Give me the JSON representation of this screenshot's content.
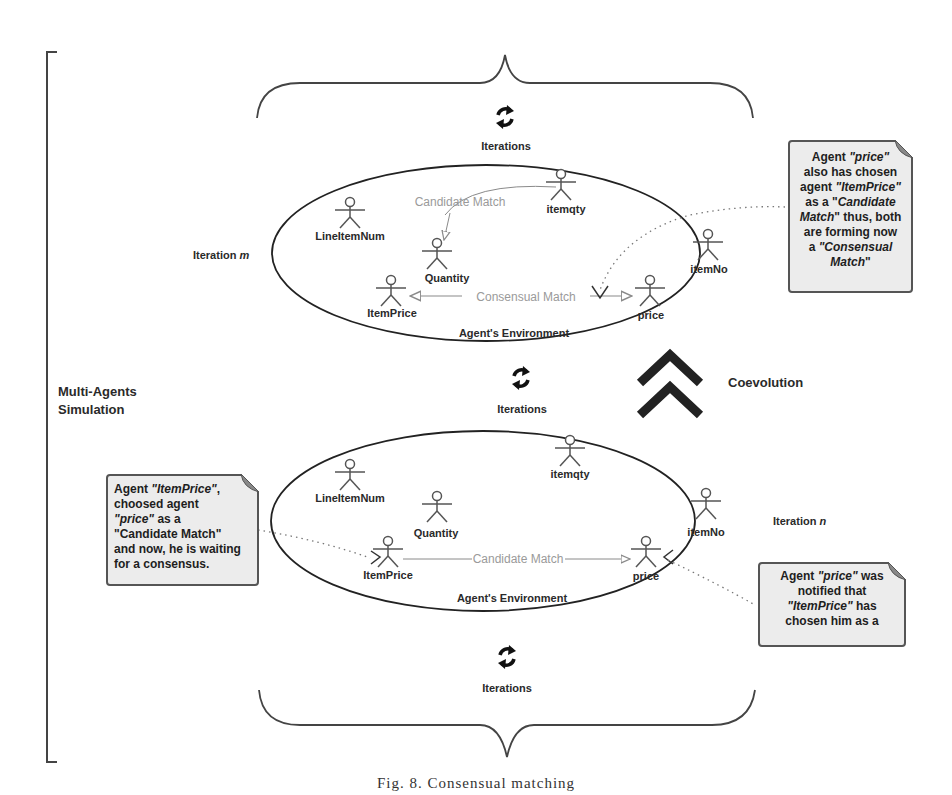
{
  "diagram": {
    "side_label": "Multi-Agents Simulation",
    "side_label_lines": [
      "Multi-Agents",
      "Simulation"
    ],
    "coevolution_label": "Coevolution",
    "iterations_labels": [
      "Iterations",
      "Iterations",
      "Iterations"
    ],
    "iteration_m": {
      "label": "Iteration ",
      "var": "m"
    },
    "iteration_n": {
      "label": "Iteration ",
      "var": "n"
    },
    "env_top": {
      "environment_label": "Agent's Environment",
      "agents": [
        "LineItemNum",
        "itemqty",
        "Quantity",
        "ItemPrice",
        "price",
        "itemNo"
      ],
      "candidate_match_label": "Candidate Match",
      "consensual_match_label": "Consensual Match"
    },
    "env_bottom": {
      "environment_label": "Agent's Environment",
      "agents": [
        "LineItemNum",
        "itemqty",
        "Quantity",
        "ItemPrice",
        "price",
        "itemNo"
      ],
      "candidate_match_label": "Candidate Match"
    },
    "notes": {
      "top_right": {
        "lines": [
          [
            {
              "t": "Agent "
            },
            {
              "t": "\"price\"",
              "i": true
            }
          ],
          [
            {
              "t": "also has chosen"
            }
          ],
          [
            {
              "t": "agent "
            },
            {
              "t": "\"ItemPrice\"",
              "i": true
            }
          ],
          [
            {
              "t": "as a \""
            },
            {
              "t": "Candidate",
              "i": true
            }
          ],
          [
            {
              "t": "Match",
              "i": true
            },
            {
              "t": "\" thus, both"
            }
          ],
          [
            {
              "t": "are forming now"
            }
          ],
          [
            {
              "t": "a  "
            },
            {
              "t": "\"Consensual",
              "i": true
            }
          ],
          [
            {
              "t": "Match",
              "i": true
            },
            {
              "t": "\""
            }
          ]
        ]
      },
      "bottom_left": {
        "lines": [
          [
            {
              "t": "Agent "
            },
            {
              "t": "\"ItemPrice\"",
              "i": true
            },
            {
              "t": ","
            }
          ],
          [
            {
              "t": "choosed agent"
            }
          ],
          [
            {
              "t": "\"price\"",
              "i": true
            },
            {
              "t": " as a"
            }
          ],
          [
            {
              "t": "\"Candidate Match\""
            }
          ],
          [
            {
              "t": "and now, he is waiting"
            }
          ],
          [
            {
              "t": "for a consensus."
            }
          ]
        ]
      },
      "bottom_right": {
        "lines": [
          [
            {
              "t": "Agent "
            },
            {
              "t": "\"price\"",
              "i": true
            },
            {
              "t": " was"
            }
          ],
          [
            {
              "t": "notified that"
            }
          ],
          [
            {
              "t": "\"ItemPrice\"",
              "i": true
            },
            {
              "t": " has"
            }
          ],
          [
            {
              "t": "chosen him as a"
            }
          ]
        ]
      }
    },
    "caption": "Fig. 8.   Consensual matching",
    "colors": {
      "line": "#333333",
      "match_arrow": "#8a8a8a",
      "note_bg": "#ececec",
      "note_border": "#555555"
    },
    "icons": {
      "iterations": "refresh-icon",
      "coevolution": "double-chevron-up-icon",
      "agent": "actor-icon"
    }
  }
}
